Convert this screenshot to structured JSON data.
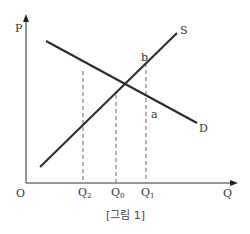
{
  "diagram": {
    "caption": "[그림 1]",
    "axes": {
      "y_label": "P",
      "x_label": "Q",
      "origin_label": "O"
    },
    "curves": [
      {
        "name": "demand",
        "label": "D",
        "slope": "downward"
      },
      {
        "name": "supply",
        "label": "S",
        "slope": "upward"
      }
    ],
    "x_ticks": [
      {
        "key": "q2",
        "main": "Q",
        "sub": "2"
      },
      {
        "key": "q0",
        "main": "Q",
        "sub": "0"
      },
      {
        "key": "q1",
        "main": "Q",
        "sub": "1"
      }
    ],
    "points": [
      {
        "key": "b",
        "label": "b",
        "on": "supply",
        "at": "Q1"
      },
      {
        "key": "a",
        "label": "a",
        "on": "demand",
        "at": "Q1"
      }
    ],
    "line_color": "#2a2a2a",
    "dash_color": "#666666"
  }
}
